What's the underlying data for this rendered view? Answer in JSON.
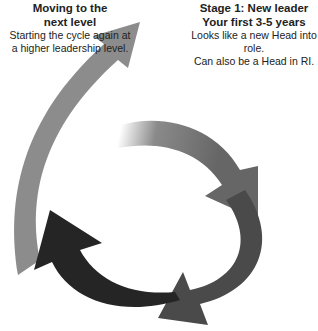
{
  "labels": {
    "next_level": {
      "title_line1": "Moving to the",
      "title_line2": "next level",
      "desc_line1": "Starting the cycle again at",
      "desc_line2": "a higher leadership level."
    },
    "stage1": {
      "title_line1": "Stage 1: New leader",
      "title_line2": "Your first 3-5 years",
      "desc_line1": "Looks like a new Head into role.",
      "desc_line2": "Can also be a Head in RI."
    }
  },
  "colors": {
    "outer_arrow": "#8c8c8c",
    "stage1_arrow": "#6a6a6a",
    "stage2_arrow": "#4a4a4a",
    "stage3_arrow": "#252525",
    "text": "#222222"
  }
}
